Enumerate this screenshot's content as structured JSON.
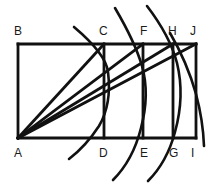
{
  "figure": {
    "canvas": {
      "width": 212,
      "height": 183
    },
    "stroke_color": "#111111",
    "background_color": "#ffffff",
    "line_width": 2.6,
    "labels": [
      {
        "id": "B",
        "text": "B",
        "x": 14,
        "y": 25
      },
      {
        "id": "C",
        "text": "C",
        "x": 99,
        "y": 25
      },
      {
        "id": "F",
        "text": "F",
        "x": 140,
        "y": 25
      },
      {
        "id": "H",
        "text": "H",
        "x": 168,
        "y": 25
      },
      {
        "id": "J",
        "text": "J",
        "x": 190,
        "y": 25
      },
      {
        "id": "A",
        "text": "A",
        "x": 14,
        "y": 147
      },
      {
        "id": "D",
        "text": "D",
        "x": 99,
        "y": 147
      },
      {
        "id": "E",
        "text": "E",
        "x": 140,
        "y": 147
      },
      {
        "id": "G",
        "text": "G",
        "x": 169,
        "y": 147
      },
      {
        "id": "I",
        "text": "I",
        "x": 191,
        "y": 147
      }
    ],
    "points": {
      "A": {
        "x": 18,
        "y": 138
      },
      "B": {
        "x": 18,
        "y": 44
      },
      "C": {
        "x": 104,
        "y": 44
      },
      "D": {
        "x": 104,
        "y": 138
      },
      "E": {
        "x": 143,
        "y": 138
      },
      "F": {
        "x": 143,
        "y": 44
      },
      "G": {
        "x": 173,
        "y": 138
      },
      "H": {
        "x": 173,
        "y": 44
      },
      "I": {
        "x": 196,
        "y": 138
      },
      "J": {
        "x": 196,
        "y": 44
      }
    },
    "segments": [
      {
        "name": "rect-left-AB",
        "from": "A",
        "to": "B"
      },
      {
        "name": "rect-top-BJ",
        "from": "B",
        "to": "J"
      },
      {
        "name": "rect-right-JI",
        "from": "J",
        "to": "I"
      },
      {
        "name": "rect-bottom-IA",
        "from": "I",
        "to": "A"
      },
      {
        "name": "divider-CD",
        "from": "C",
        "to": "D"
      },
      {
        "name": "divider-FE",
        "from": "F",
        "to": "E"
      },
      {
        "name": "divider-HG",
        "from": "H",
        "to": "G"
      },
      {
        "name": "diagonal-AC",
        "from": "A",
        "to": "C"
      },
      {
        "name": "diagonal-AF",
        "from": "A",
        "to": "F"
      },
      {
        "name": "diagonal-AH",
        "from": "A",
        "to": "H"
      },
      {
        "name": "diagonal-AJ",
        "from": "A",
        "to": "J"
      }
    ],
    "arcs": [
      {
        "name": "arc-through-C-D",
        "center": "A",
        "through": "C",
        "radius": 120
      },
      {
        "name": "arc-through-F-E",
        "center": "A",
        "through": "F",
        "radius": 155
      },
      {
        "name": "arc-through-H-G",
        "center": "A",
        "through": "H",
        "radius": 182
      },
      {
        "name": "arc-through-J-I",
        "center": "A",
        "through": "J",
        "radius": 203
      }
    ]
  }
}
